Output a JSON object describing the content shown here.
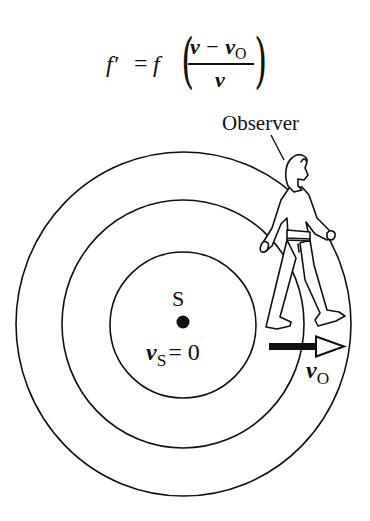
{
  "formula": {
    "lhs": "f′",
    "equals": "=",
    "factor": "f",
    "open_paren": "(",
    "close_paren": ")",
    "numerator_v": "v",
    "minus": "−",
    "numerator_vo": "v",
    "numerator_vo_sub": "O",
    "denominator": "v"
  },
  "observer_label": "Observer",
  "source": {
    "label": "S",
    "velocity_symbol": "v",
    "velocity_sub": "S",
    "velocity_eq": "= 0"
  },
  "observer_velocity": {
    "symbol": "v",
    "sub": "O"
  },
  "wavefronts": {
    "count": 3,
    "center": [
      183,
      324
    ],
    "radii": [
      73,
      121,
      170
    ],
    "stroke_color": "#111111"
  },
  "colors": {
    "ink": "#111111",
    "background": "#ffffff"
  }
}
